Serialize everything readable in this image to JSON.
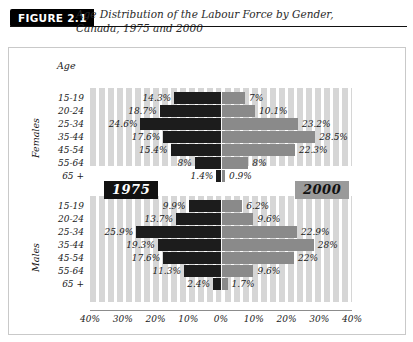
{
  "header": {
    "figure_tag": "FIGURE 2.1",
    "title_line1": "Age Distribution of the Labour Force by Gender,",
    "title_line2": "Canada, 1975 and 2000"
  },
  "axis_title": "Age",
  "gender_labels": {
    "females": "Females",
    "males": "Males"
  },
  "legend": {
    "left": "1975",
    "right": "2000"
  },
  "colors": {
    "series_1975": "#1c1c1c",
    "series_2000": "#8a8a8a",
    "stripe": "#d6d6d6"
  },
  "xaxis": {
    "ticks": [
      "40%",
      "30%",
      "20%",
      "10%",
      "0%",
      "10%",
      "20%",
      "30%",
      "40%"
    ],
    "max": 40
  },
  "chart_data": {
    "type": "bar",
    "orientation": "horizontal-diverging",
    "title": "Age Distribution of the Labour Force by Gender, Canada, 1975 and 2000",
    "xlabel": "",
    "ylabel": "Age",
    "xlim": [
      -40,
      40
    ],
    "grid": true,
    "legend_position": "inside-middle",
    "categories": [
      "15-19",
      "20-24",
      "25-34",
      "35-44",
      "45-54",
      "55-64",
      "65 +"
    ],
    "panels": [
      {
        "name": "Females",
        "series": [
          {
            "name": "1975",
            "side": "left",
            "values": [
              14.3,
              18.7,
              24.6,
              17.6,
              15.4,
              8.0,
              1.4
            ],
            "labels": [
              "14.3%",
              "18.7%",
              "24.6%",
              "17.6%",
              "15.4%",
              "8%",
              "1.4%"
            ]
          },
          {
            "name": "2000",
            "side": "right",
            "values": [
              7.0,
              10.1,
              23.2,
              28.5,
              22.3,
              8.0,
              0.9
            ],
            "labels": [
              "7%",
              "10.1%",
              "23.2%",
              "28.5%",
              "22.3%",
              "8%",
              "0.9%"
            ]
          }
        ]
      },
      {
        "name": "Males",
        "series": [
          {
            "name": "1975",
            "side": "left",
            "values": [
              9.9,
              13.7,
              25.9,
              19.3,
              17.6,
              11.3,
              2.4
            ],
            "labels": [
              "9.9%",
              "13.7%",
              "25.9%",
              "19.3%",
              "17.6%",
              "11.3%",
              "2.4%"
            ]
          },
          {
            "name": "2000",
            "side": "right",
            "values": [
              6.2,
              9.6,
              22.9,
              28.0,
              22.0,
              9.6,
              1.7
            ],
            "labels": [
              "6.2%",
              "9.6%",
              "22.9%",
              "28%",
              "22%",
              "9.6%",
              "1.7%"
            ]
          }
        ]
      }
    ]
  }
}
